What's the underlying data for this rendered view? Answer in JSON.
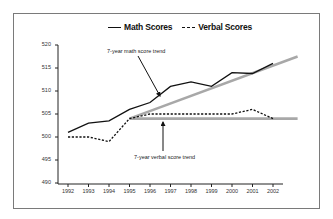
{
  "legend": {
    "math_label": "Math Scores",
    "verbal_label": "Verbal Scores"
  },
  "annotations": {
    "math_trend": "7-year math score trend",
    "verbal_trend": "7-year verbal score trend"
  },
  "colors": {
    "math_line": "#111111",
    "verbal_line": "#111111",
    "trend_line": "#a8a8a8",
    "frame": "#7a7a7a"
  },
  "axis": {
    "y_ticks": [
      "520",
      "515",
      "510",
      "505",
      "500",
      "495",
      "490"
    ],
    "x_ticks": [
      "1992",
      "1993",
      "1994",
      "1995",
      "1996",
      "1997",
      "1998",
      "1999",
      "2000",
      "2001",
      "2002"
    ]
  },
  "chart_data": {
    "type": "line",
    "title": "",
    "xlabel": "",
    "ylabel": "",
    "x": [
      1992,
      1993,
      1994,
      1995,
      1996,
      1997,
      1998,
      1999,
      2000,
      2001,
      2002
    ],
    "ylim": [
      490,
      520
    ],
    "grid": false,
    "legend_position": "top",
    "series": [
      {
        "name": "Math Scores",
        "style": "solid",
        "values": [
          501,
          503,
          503.5,
          506,
          507.5,
          511,
          512,
          511,
          514,
          513.8,
          516
        ]
      },
      {
        "name": "Verbal Scores",
        "style": "dashed",
        "values": [
          500,
          500,
          499,
          504,
          505,
          505,
          505,
          505,
          505,
          506,
          504
        ]
      },
      {
        "name": "7-year math score trend",
        "style": "gray-thick",
        "x": [
          1995,
          2003.2
        ],
        "values": [
          504,
          517.5
        ]
      },
      {
        "name": "7-year verbal score trend",
        "style": "gray-thick",
        "x": [
          1995,
          2003.2
        ],
        "values": [
          504,
          504
        ]
      }
    ],
    "annotations": [
      {
        "text": "7-year math score trend",
        "points_to": "math trend line near 1996"
      },
      {
        "text": "7-year verbal score trend",
        "points_to": "verbal trend line near 1996"
      }
    ]
  }
}
